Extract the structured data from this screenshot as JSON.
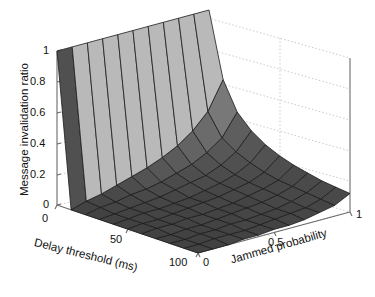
{
  "figure": {
    "type": "surface3d",
    "background": "#ffffff"
  },
  "chart_data": {
    "type": "line",
    "render": "3d-surface",
    "title": "",
    "subtitle": "",
    "xlabel": "Delay threshold (ms)",
    "ylabel": "Jammed probability",
    "zlabel": "Message invalidation ratio",
    "xlim": [
      0,
      100
    ],
    "ylim": [
      0,
      1
    ],
    "zlim": [
      0,
      1
    ],
    "xticks": [
      "0",
      "50",
      "100"
    ],
    "xtick_values": [
      0,
      50,
      100
    ],
    "yticks": [
      "0",
      "0.5",
      "1"
    ],
    "ytick_values": [
      0,
      0.5,
      1
    ],
    "zticks": [
      "0",
      "0.2",
      "0.4",
      "0.6",
      "0.8",
      "1"
    ],
    "ztick_values": [
      0,
      0.2,
      0.4,
      0.6,
      0.8,
      1
    ],
    "grid": true,
    "legend": "none",
    "colormap": "gray",
    "mesh_nx": 11,
    "mesh_ny": 11,
    "x": [
      0,
      10,
      20,
      30,
      40,
      50,
      60,
      70,
      80,
      90,
      100
    ],
    "y": [
      0,
      0.1,
      0.2,
      0.3,
      0.4,
      0.5,
      0.6,
      0.7,
      0.8,
      0.9,
      1.0
    ],
    "z_rows_by_jammed_probability": [
      {
        "jammed_probability": 0.0,
        "values": [
          1.0,
          0.0,
          0.0,
          0.0,
          0.0,
          0.0,
          0.0,
          0.0,
          0.0,
          0.0,
          0.0
        ]
      },
      {
        "jammed_probability": 0.1,
        "values": [
          1.0,
          0.03,
          0.02,
          0.01,
          0.01,
          0.01,
          0.01,
          0.0,
          0.0,
          0.0,
          0.0
        ]
      },
      {
        "jammed_probability": 0.2,
        "values": [
          1.0,
          0.05,
          0.03,
          0.02,
          0.02,
          0.01,
          0.01,
          0.01,
          0.01,
          0.01,
          0.0
        ]
      },
      {
        "jammed_probability": 0.3,
        "values": [
          1.0,
          0.08,
          0.05,
          0.03,
          0.02,
          0.02,
          0.02,
          0.01,
          0.01,
          0.01,
          0.01
        ]
      },
      {
        "jammed_probability": 0.4,
        "values": [
          1.0,
          0.11,
          0.06,
          0.04,
          0.03,
          0.03,
          0.02,
          0.02,
          0.02,
          0.01,
          0.01
        ]
      },
      {
        "jammed_probability": 0.5,
        "values": [
          1.0,
          0.14,
          0.08,
          0.06,
          0.04,
          0.04,
          0.03,
          0.03,
          0.02,
          0.02,
          0.02
        ]
      },
      {
        "jammed_probability": 0.6,
        "values": [
          1.0,
          0.18,
          0.11,
          0.08,
          0.06,
          0.05,
          0.04,
          0.04,
          0.03,
          0.03,
          0.02
        ]
      },
      {
        "jammed_probability": 0.7,
        "values": [
          1.0,
          0.23,
          0.14,
          0.1,
          0.08,
          0.07,
          0.06,
          0.05,
          0.04,
          0.04,
          0.03
        ]
      },
      {
        "jammed_probability": 0.8,
        "values": [
          1.0,
          0.3,
          0.19,
          0.14,
          0.11,
          0.09,
          0.08,
          0.07,
          0.06,
          0.05,
          0.05
        ]
      },
      {
        "jammed_probability": 0.9,
        "values": [
          1.0,
          0.4,
          0.26,
          0.2,
          0.16,
          0.13,
          0.11,
          0.1,
          0.09,
          0.08,
          0.07
        ]
      },
      {
        "jammed_probability": 1.0,
        "values": [
          1.0,
          0.58,
          0.4,
          0.31,
          0.25,
          0.21,
          0.18,
          0.16,
          0.14,
          0.13,
          0.12
        ]
      }
    ],
    "annotations": []
  },
  "axes": {
    "z_title": "Message invalidation ratio",
    "x_title": "Delay threshold (ms)",
    "y_title": "Jammed probability",
    "z_ticks": [
      "1",
      "0.8",
      "0.6",
      "0.4",
      "0.2",
      "0"
    ],
    "x_ticks": [
      "0",
      "50",
      "100"
    ],
    "y_ticks": [
      "0",
      "0.5",
      "1"
    ]
  },
  "colors": {
    "background": "#ffffff",
    "axis_line": "#6b6b6b",
    "grid_dotted": "#c8c8c8",
    "mesh_line": "#1c1c1c",
    "surface_dark": "#4a4a4a",
    "surface_mid": "#7d7d7d",
    "surface_light": "#b9b9b9",
    "surface_floor": "#585858",
    "text": "#111111"
  }
}
